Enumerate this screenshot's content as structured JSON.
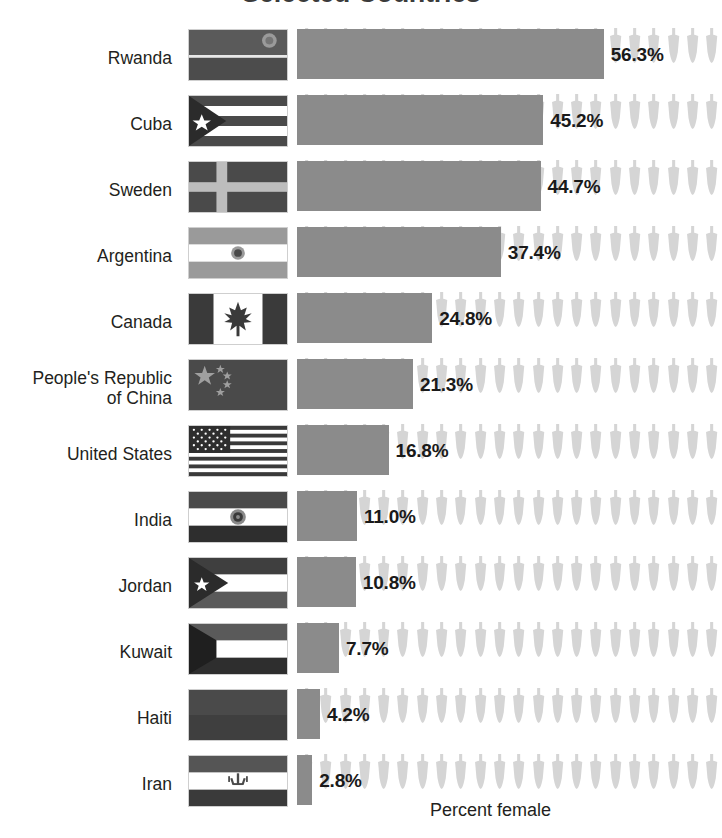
{
  "chart_data": {
    "type": "bar",
    "title": "Selected Countries",
    "subtitle": "",
    "xlabel": "Percent female",
    "ylabel": "",
    "orientation": "horizontal",
    "grid": false,
    "legend": null,
    "xlim": [
      0,
      78
    ],
    "value_suffix": "%",
    "categories": [
      "Rwanda",
      "Cuba",
      "Sweden",
      "Argentina",
      "Canada",
      "People's Republic\nof China",
      "United States",
      "India",
      "Jordan",
      "Kuwait",
      "Haiti",
      "Iran"
    ],
    "values": [
      56.3,
      45.2,
      44.7,
      37.4,
      24.8,
      21.3,
      16.8,
      11.0,
      10.8,
      7.7,
      4.2,
      2.8
    ],
    "value_labels": [
      "56.3%",
      "45.2%",
      "44.7%",
      "37.4%",
      "24.8%",
      "21.3%",
      "16.8%",
      "11.0%",
      "10.8%",
      "7.7%",
      "4.2%",
      "2.8%"
    ],
    "flags": [
      "rwanda-flag",
      "cuba-flag",
      "sweden-flag",
      "argentina-flag",
      "canada-flag",
      "china-flag",
      "united-states-flag",
      "india-flag",
      "jordan-flag",
      "kuwait-flag",
      "haiti-flag",
      "iran-flag"
    ],
    "pictogram": {
      "icon": "person-icon",
      "count_per_row": 22,
      "color": "#d5d5d5"
    },
    "colors": {
      "bar": "#8b8b8b",
      "pictogram": "#d5d5d5",
      "text": "#231f20",
      "title": "#3b3b3b",
      "background": "#ffffff"
    }
  }
}
